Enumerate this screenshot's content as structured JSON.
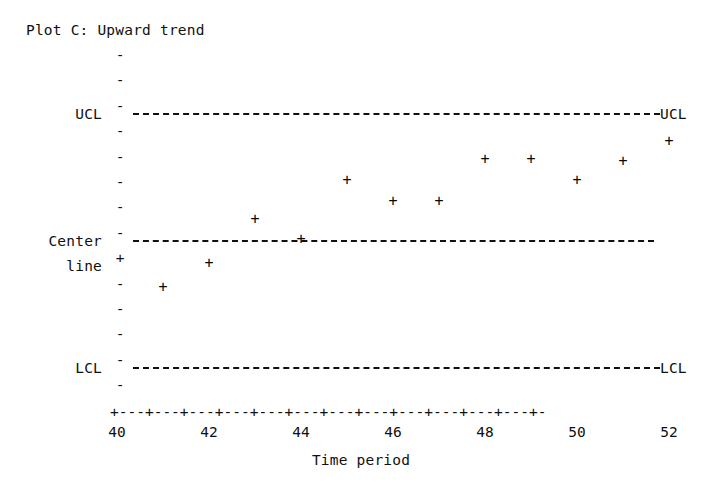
{
  "chart_data": {
    "type": "scatter",
    "title": "Plot C: Upward trend",
    "xlabel": "Time period",
    "ylabel": "",
    "x": [
      40,
      41,
      42,
      43,
      44,
      45,
      46,
      47,
      48,
      49,
      50,
      51,
      52
    ],
    "values": [
      -0.45,
      -0.9,
      -0.45,
      0.37,
      0.0,
      1.12,
      0.72,
      0.72,
      1.52,
      1.52,
      1.12,
      1.48,
      1.85
    ],
    "categories": [
      "40",
      "41",
      "42",
      "43",
      "44",
      "45",
      "46",
      "47",
      "48",
      "49",
      "50",
      "51",
      "52"
    ],
    "xticks": [
      "40",
      "42",
      "44",
      "46",
      "48",
      "50",
      "52"
    ],
    "xlim": [
      40,
      52
    ],
    "ylim": [
      -2.6,
      3.2
    ],
    "grid": false,
    "legend": "none",
    "marker": "+",
    "control_limits": {
      "ucl_label": "UCL",
      "ucl_value": 2.4,
      "center_label_line1": "Center",
      "center_label_line2": "line",
      "center_value": 0.0,
      "lcl_label": "LCL",
      "lcl_value": -2.4
    },
    "annotations": {
      "ucl_right": "UCL",
      "lcl_right": "LCL"
    },
    "series_note": "Upward trend: points drift from below center line toward the upper control limit."
  },
  "glyphs": {
    "tick_dash": "-",
    "point_plus": "+",
    "x_axis_row": "+---+---+---+---+---+---+---+---+---+---+---+---+-"
  }
}
